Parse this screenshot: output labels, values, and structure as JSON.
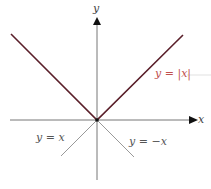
{
  "diagram": {
    "axes": {
      "x_label": "x",
      "y_label": "y"
    },
    "curves": [
      {
        "name": "abs",
        "label": "y = |x|",
        "color": "#5a1f2a"
      },
      {
        "name": "identity",
        "label": "y = x",
        "color": "#888888"
      },
      {
        "name": "negative",
        "label": "y = −x",
        "color": "#888888"
      }
    ],
    "label_colors": {
      "abs": "#c0504d",
      "other": "#555555"
    }
  }
}
